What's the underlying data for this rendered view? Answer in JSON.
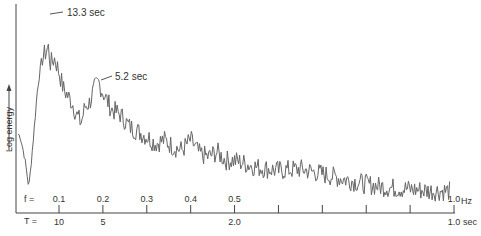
{
  "chart_data": {
    "type": "line",
    "title": "",
    "xlabel": "f (Hz) / T (sec)",
    "ylabel": "Log energy",
    "y_axis_arrow": true,
    "x_axis": {
      "f_prefix": "f =",
      "T_prefix": "T =",
      "f_unit": "Hz",
      "T_unit": "sec",
      "ticks_f": [
        0.1,
        0.2,
        0.3,
        0.4,
        0.5,
        0.6,
        0.7,
        0.8,
        0.9,
        1.0
      ],
      "f_tick_labels": [
        "0.1",
        "0.2",
        "0.3",
        "0.4",
        "0.5",
        "",
        "",
        "",
        "",
        "1.0"
      ],
      "T_tick_labels": [
        "10",
        "5",
        "",
        "",
        "2.0",
        "",
        "",
        "",
        "",
        "1.0"
      ],
      "xlim": [
        0.0,
        1.0
      ]
    },
    "annotations": [
      {
        "text": "13.3 sec",
        "f": 0.075
      },
      {
        "text": "5.2 sec",
        "f": 0.19
      }
    ],
    "grid": false,
    "legend": null,
    "series": [
      {
        "name": "Log energy spectrum",
        "x": [
          0.0,
          0.01,
          0.02,
          0.03,
          0.04,
          0.05,
          0.06,
          0.07,
          0.075,
          0.08,
          0.09,
          0.1,
          0.11,
          0.12,
          0.13,
          0.14,
          0.15,
          0.16,
          0.17,
          0.18,
          0.19,
          0.2,
          0.22,
          0.24,
          0.26,
          0.28,
          0.3,
          0.32,
          0.34,
          0.36,
          0.38,
          0.4,
          0.42,
          0.44,
          0.46,
          0.48,
          0.5,
          0.55,
          0.6,
          0.65,
          0.7,
          0.75,
          0.8,
          0.85,
          0.9,
          0.95,
          1.0
        ],
        "values": [
          0.45,
          0.42,
          0.3,
          0.12,
          0.4,
          0.7,
          0.88,
          0.92,
          0.95,
          0.85,
          0.88,
          0.8,
          0.7,
          0.66,
          0.62,
          0.55,
          0.5,
          0.6,
          0.62,
          0.7,
          0.74,
          0.68,
          0.58,
          0.55,
          0.48,
          0.45,
          0.42,
          0.38,
          0.4,
          0.36,
          0.34,
          0.4,
          0.32,
          0.3,
          0.33,
          0.28,
          0.28,
          0.24,
          0.22,
          0.23,
          0.2,
          0.17,
          0.14,
          0.12,
          0.11,
          0.1,
          0.1
        ]
      }
    ]
  }
}
